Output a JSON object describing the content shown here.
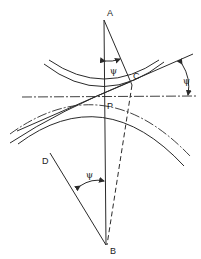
{
  "diagram": {
    "points": {
      "A": "A",
      "B": "B",
      "C": "C",
      "D": "D",
      "P": "P"
    },
    "angle_labels": {
      "top": "ψ",
      "right": "ψ",
      "bottom": "ψ"
    }
  }
}
